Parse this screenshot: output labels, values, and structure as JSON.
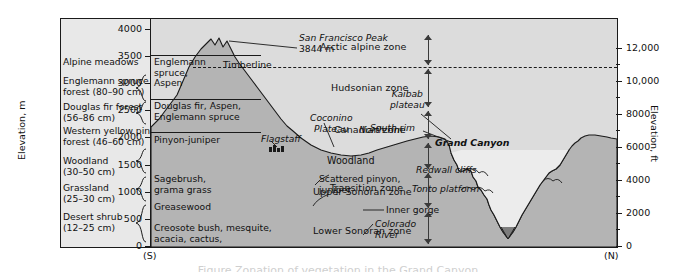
{
  "figure": {
    "title_left": "VEGETATION TYPES",
    "subtitle_left": "(rainfall)",
    "title_right": "LIFE ZONES",
    "caption": "Figure  Zonation of vegetation in the Grand Canyon"
  },
  "axes": {
    "left": {
      "title": "Elevation, m",
      "ticks": [
        "4000",
        "3500",
        "3000",
        "2500",
        "2000",
        "1500",
        "1000",
        "500",
        "0"
      ],
      "values_m": [
        4000,
        3500,
        3000,
        2500,
        2000,
        1500,
        1000,
        500,
        0
      ],
      "min": 0,
      "max": 4200
    },
    "right": {
      "title": "Elevation, ft",
      "ticks": [
        "12,000",
        "10,000",
        "8000",
        "6000",
        "4000",
        "2000",
        "0"
      ],
      "values_ft": [
        12000,
        10000,
        8000,
        6000,
        4000,
        2000,
        0
      ],
      "min": 0,
      "max": 13800
    },
    "south_marker": "(S)",
    "north_marker": "(N)"
  },
  "vegetation_types": [
    {
      "label": "Alpine meadows",
      "rainfall": ""
    },
    {
      "label": "Englemann spruce\nforest (80–90 cm)",
      "rainfall": "80–90 cm"
    },
    {
      "label": "Douglas fir forest\n(56–86 cm)",
      "rainfall": "56–86 cm"
    },
    {
      "label": "Western yellow pine\nforest (46–60 cm)",
      "rainfall": "46–60 cm"
    },
    {
      "label": "Woodland\n(30–50 cm)",
      "rainfall": "30–50 cm"
    },
    {
      "label": "Grassland\n(25–30 cm)",
      "rainfall": "25–30 cm"
    },
    {
      "label": "Desert shrub\n(12–25 cm)",
      "rainfall": "12–25 cm"
    }
  ],
  "plant_bands": [
    {
      "label": "Englemann\nspruce,\nAspen"
    },
    {
      "label": "Douglas fir, Aspen,\nEnglemann spruce"
    },
    {
      "label": "Pinyon-juniper"
    },
    {
      "label": "Sagebrush,\ngrama grass"
    },
    {
      "label": "Greasewood"
    },
    {
      "label": "Creosote bush, mesquite,\nacacia, cactus,\nyucca, agave"
    }
  ],
  "life_zones": [
    {
      "label": "Arctic alpine zone"
    },
    {
      "label": "Hudsonian zone"
    },
    {
      "label": "Canadian zone"
    },
    {
      "label": "Transition zone"
    },
    {
      "label": "Upper Sonoran zone"
    },
    {
      "label": "Lower Sonoran zone"
    }
  ],
  "features": [
    {
      "name": "san-francisco-peak",
      "label": "San Francisco Peak"
    },
    {
      "name": "peak-elevation",
      "label": "3844 m"
    },
    {
      "name": "timberline",
      "label": "Timberline"
    },
    {
      "name": "flagstaff",
      "label": "Flagstaff"
    },
    {
      "name": "coconino-plateau",
      "label": "Coconino\nPlateau"
    },
    {
      "name": "south-rim",
      "label": "South rim"
    },
    {
      "name": "woodland",
      "label": "Woodland"
    },
    {
      "name": "scattered-pinyon",
      "label": "Scattered pinyon,\njuniper"
    },
    {
      "name": "grand-canyon",
      "label": "Grand Canyon"
    },
    {
      "name": "redwall-cliffs",
      "label": "Redwall cliffs"
    },
    {
      "name": "tonto-platform",
      "label": "Tonto platform"
    },
    {
      "name": "inner-gorge",
      "label": "Inner gorge"
    },
    {
      "name": "colorado-river",
      "label": "Colorado\nRiver"
    },
    {
      "name": "north-rim",
      "label": "North rim"
    },
    {
      "name": "kaibab-plateau",
      "label": "Kaibab\nplateau"
    }
  ],
  "colors": {
    "plot_background": "#d9d9d9",
    "legend_background": "#e8e8e8",
    "terrain_fill": "#b4b4b4",
    "sky_fill": "#e4e4e4",
    "line": "#1a1a1a"
  }
}
